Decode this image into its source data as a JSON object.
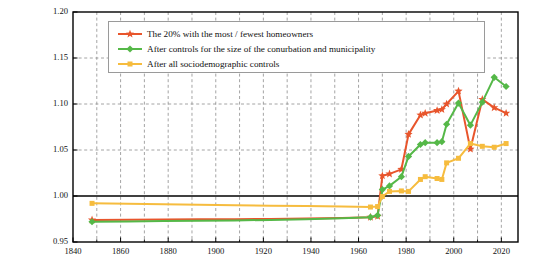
{
  "chart_data": {
    "type": "line",
    "title": "",
    "xlabel": "",
    "ylabel_line1": "Ratio between the rate of turnout in the 20% of the",
    "ylabel_line2": "municipalities with the most and fewest homeowners",
    "xlim": [
      1840,
      2027
    ],
    "ylim": [
      0.95,
      1.2
    ],
    "xticks": [
      1840,
      1860,
      1880,
      1900,
      1920,
      1940,
      1960,
      1980,
      2000,
      2020
    ],
    "xticks_minor": [
      1850,
      1870,
      1890,
      1910,
      1930,
      1950,
      1970,
      1990,
      2010
    ],
    "yticks": [
      0.95,
      1.0,
      1.05,
      1.1,
      1.15,
      1.2
    ],
    "ytick_labels": [
      "0.95",
      "1.00",
      "1.05",
      "1.10",
      "1.15",
      "1.20"
    ],
    "grid": true,
    "grid_style": "dashed",
    "reference_line": 1.0,
    "legend_position": "upper left",
    "series": [
      {
        "name": "The 20% with the most / fewest homeowners",
        "color": "#E8552C",
        "marker": "star",
        "x": [
          1848,
          1863,
          1878,
          1893,
          1908,
          1923,
          1938,
          1953,
          1965,
          1968,
          1970,
          1973,
          1978,
          1981,
          1986,
          1988,
          1993,
          1995,
          1997,
          2002,
          2007,
          2012,
          2017,
          2022
        ],
        "values": [
          0.974,
          0.9742,
          0.9744,
          0.9746,
          0.9748,
          0.975,
          0.9755,
          0.976,
          0.977,
          0.978,
          1.022,
          1.024,
          1.029,
          1.067,
          1.088,
          1.09,
          1.093,
          1.094,
          1.1,
          1.114,
          1.051,
          1.105,
          1.096,
          1.09
        ]
      },
      {
        "name": "After controls for the size of the conurbation and municipality",
        "color": "#55B848",
        "marker": "diamond",
        "x": [
          1848,
          1863,
          1878,
          1893,
          1908,
          1923,
          1938,
          1953,
          1965,
          1968,
          1970,
          1973,
          1978,
          1981,
          1986,
          1988,
          1993,
          1995,
          1997,
          2002,
          2007,
          2012,
          2017,
          2022
        ],
        "values": [
          0.972,
          0.9723,
          0.9727,
          0.973,
          0.9735,
          0.974,
          0.9748,
          0.9758,
          0.977,
          0.979,
          1.007,
          1.011,
          1.021,
          1.043,
          1.056,
          1.058,
          1.058,
          1.059,
          1.078,
          1.101,
          1.077,
          1.102,
          1.129,
          1.119
        ]
      },
      {
        "name": "After all sociodemographic controls",
        "color": "#F6BC3E",
        "marker": "square",
        "x": [
          1848,
          1863,
          1878,
          1893,
          1908,
          1923,
          1938,
          1953,
          1965,
          1968,
          1970,
          1973,
          1978,
          1981,
          1986,
          1988,
          1993,
          1995,
          1997,
          2002,
          2007,
          2012,
          2017,
          2022
        ],
        "values": [
          0.992,
          0.9915,
          0.991,
          0.9905,
          0.99,
          0.9895,
          0.989,
          0.9885,
          0.988,
          0.9885,
          0.9995,
          1.005,
          1.0055,
          1.005,
          1.018,
          1.021,
          1.019,
          1.018,
          1.036,
          1.041,
          1.057,
          1.054,
          1.053,
          1.057
        ]
      }
    ]
  },
  "legend": {
    "items": [
      {
        "label": "The 20% with the most / fewest homeowners",
        "color": "#E8552C",
        "marker": "star"
      },
      {
        "label": "After controls for the size of the conurbation and municipality",
        "color": "#55B848",
        "marker": "diamond"
      },
      {
        "label": "After all sociodemographic controls",
        "color": "#F6BC3E",
        "marker": "square"
      }
    ]
  }
}
